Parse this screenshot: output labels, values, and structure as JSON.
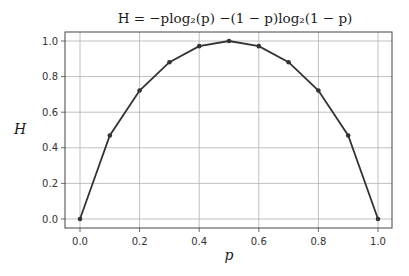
{
  "chart_data": {
    "type": "line",
    "title": "H = −plog₂(p) −(1 − p)log₂(1 − p)",
    "xlabel": "p",
    "ylabel": "H",
    "x": [
      0.0,
      0.1,
      0.2,
      0.3,
      0.4,
      0.5,
      0.6,
      0.7,
      0.8,
      0.9,
      1.0
    ],
    "series": [
      {
        "name": "H",
        "values": [
          0.0,
          0.469,
          0.722,
          0.881,
          0.971,
          1.0,
          0.971,
          0.881,
          0.722,
          0.469,
          0.0
        ]
      }
    ],
    "xticks": [
      "0.0",
      "0.2",
      "0.4",
      "0.6",
      "0.8",
      "1.0"
    ],
    "yticks": [
      "0.0",
      "0.2",
      "0.4",
      "0.6",
      "0.8",
      "1.0"
    ],
    "xlim": [
      -0.05,
      1.05
    ],
    "ylim": [
      -0.05,
      1.05
    ],
    "grid": true,
    "legend": null,
    "line_color": "#333333",
    "marker": "circle"
  }
}
